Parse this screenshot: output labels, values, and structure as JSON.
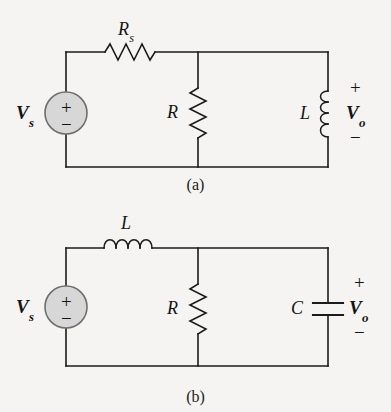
{
  "page": {
    "background_color": "#f5f4f2",
    "ink_color": "#1b1b1b",
    "source_fill_color": "#d7d7d7",
    "source_stroke_color": "#6e6e6e"
  },
  "figures": [
    {
      "id": "a",
      "caption": "(a)",
      "source": {
        "name": "voltage-source",
        "label": "V",
        "subscript": "s",
        "plus": "+",
        "minus": "−"
      },
      "components": [
        {
          "name": "series-resistor",
          "type": "resistor",
          "orientation": "horizontal",
          "label": "R",
          "subscript": "s"
        },
        {
          "name": "shunt-resistor",
          "type": "resistor",
          "orientation": "vertical",
          "label": "R",
          "subscript": ""
        },
        {
          "name": "load-inductor",
          "type": "inductor",
          "orientation": "vertical",
          "label": "L",
          "subscript": ""
        }
      ],
      "output": {
        "name": "output-voltage",
        "label": "V",
        "subscript": "o",
        "plus": "+",
        "minus": "−"
      }
    },
    {
      "id": "b",
      "caption": "(b)",
      "source": {
        "name": "voltage-source",
        "label": "V",
        "subscript": "s",
        "plus": "+",
        "minus": "−"
      },
      "components": [
        {
          "name": "series-inductor",
          "type": "inductor",
          "orientation": "horizontal",
          "label": "L",
          "subscript": ""
        },
        {
          "name": "shunt-resistor",
          "type": "resistor",
          "orientation": "vertical",
          "label": "R",
          "subscript": ""
        },
        {
          "name": "load-capacitor",
          "type": "capacitor",
          "orientation": "vertical",
          "label": "C",
          "subscript": ""
        }
      ],
      "output": {
        "name": "output-voltage",
        "label": "V",
        "subscript": "o",
        "plus": "+",
        "minus": "−"
      }
    }
  ]
}
